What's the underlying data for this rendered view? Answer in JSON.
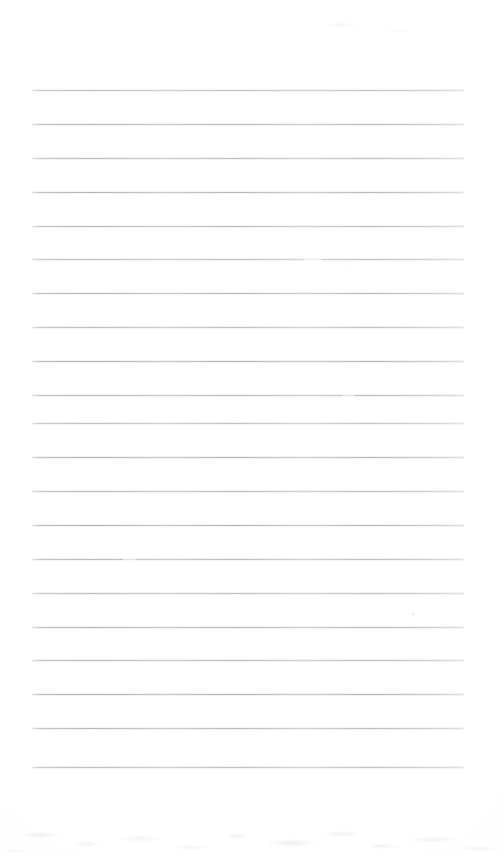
{
  "document": {
    "kind": "scanned-lined-paper",
    "title": "Blank ruled notebook page",
    "description": "A scanned blank sheet of ruled notebook paper with no written content",
    "page_width": 503,
    "page_height": 855,
    "background_color": "#ffffff",
    "has_visible_text": false,
    "has_page_border": false,
    "has_margin_rule": false
  },
  "ruling": {
    "line_color": "#b6b6be",
    "line_halo_color": "#d6d6dc",
    "line_thickness_px": 1,
    "line_count": 21,
    "left_x": 33,
    "right_x": 463,
    "line_length_px": 430,
    "first_line_y": 90,
    "last_line_y": 767,
    "line_spacing_px": 33.85,
    "line_y_positions": [
      90,
      124,
      158,
      192,
      226,
      259,
      293,
      327,
      361,
      395,
      423,
      457,
      491,
      525,
      559,
      593,
      627,
      660,
      694,
      728,
      767
    ],
    "line_breaks": [
      {
        "line_index": 5,
        "start_pct": 63,
        "width_pct": 4
      },
      {
        "line_index": 9,
        "start_pct": 72,
        "width_pct": 3
      },
      {
        "line_index": 14,
        "start_pct": 21,
        "width_pct": 3
      }
    ]
  },
  "artifacts": {
    "specks": [
      {
        "x": 412,
        "y": 613,
        "size": 2
      },
      {
        "x": 344,
        "y": 271,
        "size": 1
      }
    ],
    "noise_band": {
      "label": "scanner-noise-bottom",
      "top": 800,
      "height": 55
    },
    "noise_top": {
      "label": "scanner-noise-top",
      "top": 10,
      "left": 300,
      "width": 140,
      "height": 30
    }
  },
  "margins": {
    "top_blank_px": 90,
    "bottom_blank_px": 88,
    "left_px": 33,
    "right_px": 40
  }
}
